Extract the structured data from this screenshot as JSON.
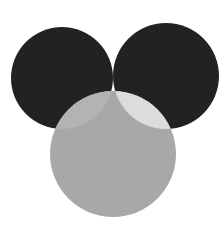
{
  "diagram": {
    "type": "three-circle-venn",
    "canvas": {
      "width": 224,
      "height": 233,
      "background": "#ffffff"
    },
    "circles": [
      {
        "id": "left",
        "cx": 62,
        "cy": 78,
        "r": 51,
        "fill": "#222222"
      },
      {
        "id": "right",
        "cx": 166,
        "cy": 76,
        "r": 53,
        "fill": "#222222"
      },
      {
        "id": "bottom",
        "cx": 113,
        "cy": 154,
        "r": 63,
        "fill": "#a8a8a8"
      }
    ],
    "regions": {
      "left_right_overlap": "#555555",
      "left_bottom_overlap": "#b3b3b3",
      "right_bottom_overlap": "#dcdcdc",
      "center_all_three": "#ffffff"
    }
  }
}
